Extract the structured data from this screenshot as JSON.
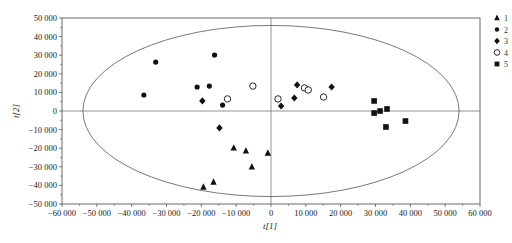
{
  "chart_data": {
    "type": "scatter",
    "title": "",
    "xlabel": "t[1]",
    "ylabel": "t[2]",
    "xlim": [
      -60000,
      60000
    ],
    "ylim": [
      -50000,
      50000
    ],
    "x_ticks": [
      "-60 000",
      "-50 000",
      "-40 000",
      "-30 000",
      "-20 000",
      "-10 000",
      "0",
      "10 000",
      "20 000",
      "30 000",
      "40 000",
      "50 000",
      "60 000"
    ],
    "y_ticks": [
      "50 000",
      "40 000",
      "30 000",
      "20 000",
      "10 000",
      "0",
      "-10 000",
      "-20 000",
      "-30 000",
      "-40 000",
      "-50 000"
    ],
    "grid": false,
    "ellipse": {
      "label": "Hotelling T2 95% ellipse",
      "cx": 0,
      "cy": 0,
      "rx": 54000,
      "ry": 46000
    },
    "legend_position": "right",
    "series": [
      {
        "name": "1",
        "marker": "triangle",
        "points": [
          [
            -10700,
            -19900
          ],
          [
            -7200,
            -21500
          ],
          [
            -5500,
            -30100
          ],
          [
            -900,
            -22600
          ],
          [
            -16500,
            -38200
          ],
          [
            -19400,
            -40900
          ]
        ]
      },
      {
        "name": "2",
        "marker": "filled-circle",
        "points": [
          [
            -36500,
            8600
          ],
          [
            -33100,
            26300
          ],
          [
            -16200,
            30100
          ],
          [
            -21200,
            12900
          ],
          [
            -17700,
            13400
          ],
          [
            -13900,
            3200
          ]
        ]
      },
      {
        "name": "3",
        "marker": "filled-diamond",
        "points": [
          [
            -19700,
            5400
          ],
          [
            -14800,
            -9100
          ],
          [
            2900,
            2700
          ],
          [
            6700,
            7000
          ],
          [
            7500,
            14000
          ],
          [
            17400,
            12900
          ]
        ]
      },
      {
        "name": "4",
        "marker": "open-circle",
        "points": [
          [
            -12500,
            6500
          ],
          [
            -5200,
            13400
          ],
          [
            2000,
            6500
          ],
          [
            9600,
            12400
          ],
          [
            10700,
            11300
          ],
          [
            15100,
            7500
          ]
        ]
      },
      {
        "name": "5",
        "marker": "filled-square",
        "points": [
          [
            29600,
            5400
          ],
          [
            29600,
            -1100
          ],
          [
            31300,
            0
          ],
          [
            33300,
            1100
          ],
          [
            33000,
            -8600
          ],
          [
            38600,
            -5400
          ]
        ]
      }
    ]
  },
  "axes": {
    "xlabel": "t[1]",
    "ylabel": "t[2]"
  },
  "legend": {
    "items": [
      {
        "label": "1",
        "marker": "triangle"
      },
      {
        "label": "2",
        "marker": "filled-circle"
      },
      {
        "label": "3",
        "marker": "filled-diamond"
      },
      {
        "label": "4",
        "marker": "open-circle"
      },
      {
        "label": "5",
        "marker": "filled-square"
      }
    ]
  }
}
